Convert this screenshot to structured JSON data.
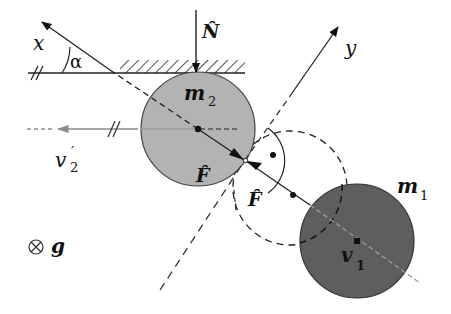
{
  "diagram": {
    "type": "physics-collision-diagram",
    "colors": {
      "mass_m2_fill": "#b3b3b3",
      "mass_m1_fill": "#5e5e5e",
      "line": "#222222",
      "velocity_arrow": "#8a8a8a",
      "background": "#ffffff"
    },
    "axes": {
      "x_label": "x",
      "y_label": "y",
      "angle_label": "α"
    },
    "forces": {
      "normal_label": "N̂",
      "impulse_label_upper": "F̂",
      "impulse_label_lower": "F̂"
    },
    "masses": {
      "m2": {
        "label_base": "m",
        "label_sub": "2"
      },
      "m1": {
        "label_base": "m",
        "label_sub": "1"
      }
    },
    "velocities": {
      "v2_prime": {
        "label_base": "v",
        "label_sup": "′",
        "label_sub": "2"
      },
      "v1": {
        "label_base": "v",
        "label_sub": "1"
      }
    },
    "gravity": {
      "symbol": "⊗",
      "label": "g"
    }
  }
}
